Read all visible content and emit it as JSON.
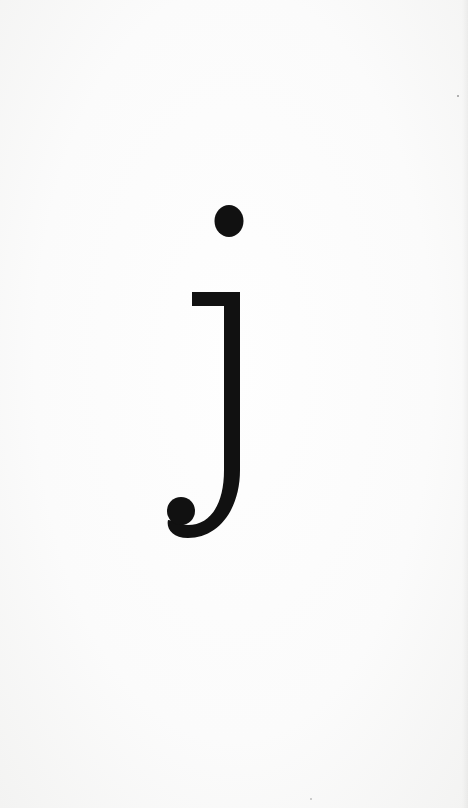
{
  "letter": {
    "character": "j",
    "case": "lowercase",
    "color": "#111111"
  },
  "background": {
    "color": "#fbfbfb"
  }
}
